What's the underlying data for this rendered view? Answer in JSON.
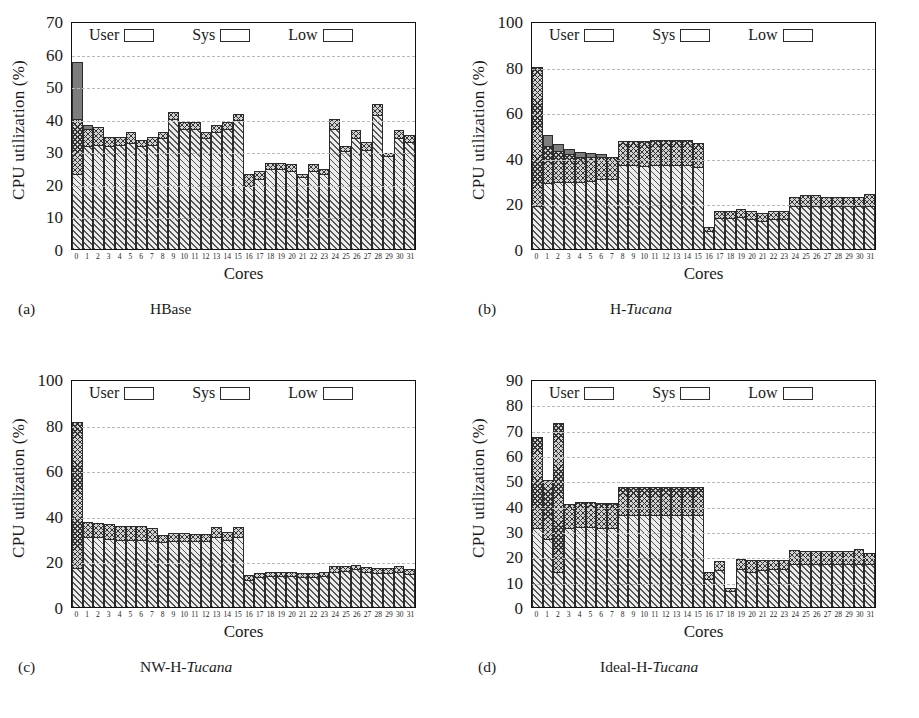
{
  "figure": {
    "axis_label_y": "CPU utilization (%)",
    "axis_label_x": "Cores",
    "legend": [
      {
        "label": "User",
        "pattern": "diagonal-hatch",
        "color": "#ececec"
      },
      {
        "label": "Sys",
        "pattern": "cross-hatch",
        "color": "#d2d2d2"
      },
      {
        "label": "Low",
        "pattern": "solid",
        "color": "#7d7d7d"
      }
    ],
    "core_labels": [
      "0",
      "1",
      "2",
      "3",
      "4",
      "5",
      "6",
      "7",
      "8",
      "9",
      "10",
      "11",
      "12",
      "13",
      "14",
      "15",
      "16",
      "17",
      "18",
      "19",
      "20",
      "21",
      "22",
      "23",
      "24",
      "25",
      "26",
      "27",
      "28",
      "29",
      "30",
      "31"
    ]
  },
  "panels": [
    {
      "tag": "(a)",
      "caption_plain": "HBase",
      "caption_italic": ""
    },
    {
      "tag": "(b)",
      "caption_plain": "H-",
      "caption_italic": "Tucana"
    },
    {
      "tag": "(c)",
      "caption_plain": "NW-H-",
      "caption_italic": "Tucana"
    },
    {
      "tag": "(d)",
      "caption_plain": "Ideal-H-",
      "caption_italic": "Tucana"
    }
  ],
  "chart_data": [
    {
      "type": "bar",
      "subplot": "(a)",
      "title": "HBase",
      "xlabel": "Cores",
      "ylabel": "CPU utilization (%)",
      "ylim": [
        0,
        70
      ],
      "yticks": [
        0,
        10,
        20,
        30,
        40,
        50,
        60,
        70
      ],
      "grid": true,
      "legend_position": "top-inside",
      "stacked": true,
      "categories": [
        "0",
        "1",
        "2",
        "3",
        "4",
        "5",
        "6",
        "7",
        "8",
        "9",
        "10",
        "11",
        "12",
        "13",
        "14",
        "15",
        "16",
        "17",
        "18",
        "19",
        "20",
        "21",
        "22",
        "23",
        "24",
        "25",
        "26",
        "27",
        "28",
        "29",
        "30",
        "31"
      ],
      "series": [
        {
          "name": "User",
          "values": [
            23,
            31.5,
            32,
            31.5,
            32,
            32.5,
            31.5,
            32,
            34,
            40,
            37,
            37,
            34,
            36,
            37,
            39.5,
            19.5,
            21.5,
            24.5,
            24.5,
            24,
            22,
            24,
            23,
            37,
            30,
            34,
            30.5,
            41,
            28.5,
            34,
            33
          ]
        },
        {
          "name": "Sys",
          "values": [
            17,
            5.5,
            5.5,
            3,
            2.5,
            3.5,
            2,
            2.5,
            2,
            2,
            2,
            2,
            2,
            2,
            2,
            2,
            3.5,
            2.5,
            2,
            2,
            2,
            1,
            2,
            1.5,
            3,
            1.5,
            2.5,
            2.5,
            3.5,
            1,
            2.5,
            2
          ]
        },
        {
          "name": "Low",
          "values": [
            17.5,
            1,
            0,
            0,
            0,
            0,
            0,
            0,
            0,
            0,
            0,
            0,
            0,
            0,
            0,
            0,
            0,
            0,
            0,
            0,
            0,
            0,
            0,
            0,
            0,
            0,
            0,
            0,
            0,
            0,
            0,
            0
          ]
        }
      ]
    },
    {
      "type": "bar",
      "subplot": "(b)",
      "title": "H-Tucana",
      "xlabel": "Cores",
      "ylabel": "CPU utilization (%)",
      "ylim": [
        0,
        100
      ],
      "yticks": [
        0,
        20,
        40,
        60,
        80,
        100
      ],
      "grid": true,
      "legend_position": "top-inside",
      "stacked": true,
      "categories": [
        "0",
        "1",
        "2",
        "3",
        "4",
        "5",
        "6",
        "7",
        "8",
        "9",
        "10",
        "11",
        "12",
        "13",
        "14",
        "15",
        "16",
        "17",
        "18",
        "19",
        "20",
        "21",
        "22",
        "23",
        "24",
        "25",
        "26",
        "27",
        "28",
        "29",
        "30",
        "31"
      ],
      "series": [
        {
          "name": "User",
          "values": [
            19,
            29,
            29.5,
            29.5,
            29.5,
            30,
            30.5,
            30.5,
            37,
            37,
            36.5,
            37,
            37,
            37,
            37,
            36,
            8,
            13.5,
            13.5,
            14,
            13,
            12.5,
            13,
            13,
            19,
            19,
            19,
            19,
            19,
            19,
            19,
            19
          ]
        },
        {
          "name": "Sys",
          "values": [
            61,
            16,
            13.5,
            12,
            11,
            10.5,
            10,
            10,
            10.5,
            10.5,
            11,
            11,
            11,
            11,
            11,
            10.5,
            1.5,
            3,
            3,
            3.5,
            3.5,
            3.5,
            3.5,
            3.5,
            4,
            4.5,
            4.5,
            4,
            4,
            4,
            4,
            5
          ]
        },
        {
          "name": "Low",
          "values": [
            0,
            5,
            3,
            2.5,
            2,
            1.5,
            1,
            0,
            0,
            0,
            0,
            0,
            0,
            0,
            0,
            0,
            0,
            0,
            0,
            0,
            0,
            0,
            0,
            0,
            0,
            0,
            0,
            0,
            0,
            0,
            0,
            0
          ]
        }
      ]
    },
    {
      "type": "bar",
      "subplot": "(c)",
      "title": "NW-H-Tucana",
      "xlabel": "Cores",
      "ylabel": "CPU utilization (%)",
      "ylim": [
        0,
        100
      ],
      "yticks": [
        0,
        20,
        40,
        60,
        80,
        100
      ],
      "grid": true,
      "legend_position": "top-inside",
      "stacked": true,
      "categories": [
        "0",
        "1",
        "2",
        "3",
        "4",
        "5",
        "6",
        "7",
        "8",
        "9",
        "10",
        "11",
        "12",
        "13",
        "14",
        "15",
        "16",
        "17",
        "18",
        "19",
        "20",
        "21",
        "22",
        "23",
        "24",
        "25",
        "26",
        "27",
        "28",
        "29",
        "30",
        "31"
      ],
      "series": [
        {
          "name": "User",
          "values": [
            17,
            30.5,
            30.5,
            30,
            29.5,
            29.5,
            29.5,
            29,
            28.5,
            29,
            29,
            29,
            29,
            30.5,
            29.5,
            30.5,
            12,
            13,
            13.5,
            13.5,
            13.5,
            13,
            13,
            13.5,
            15.5,
            16,
            16.5,
            15.5,
            15,
            15,
            15.5,
            14.5
          ]
        },
        {
          "name": "Sys",
          "values": [
            64,
            7,
            6.5,
            6.5,
            6,
            6,
            6,
            5.5,
            3,
            3.5,
            3.5,
            3,
            3,
            4.5,
            3.5,
            4.5,
            2,
            2,
            2,
            2,
            2,
            2,
            2,
            2,
            2.5,
            2,
            2,
            2,
            2,
            2,
            2.5,
            2
          ]
        },
        {
          "name": "Low",
          "values": [
            0,
            0,
            0,
            0,
            0,
            0,
            0,
            0,
            0,
            0,
            0,
            0,
            0,
            0,
            0,
            0,
            0,
            0,
            0,
            0,
            0,
            0,
            0,
            0,
            0,
            0,
            0,
            0,
            0,
            0,
            0,
            0
          ]
        }
      ]
    },
    {
      "type": "bar",
      "subplot": "(d)",
      "title": "Ideal-H-Tucana",
      "xlabel": "Cores",
      "ylabel": "CPU utilization (%)",
      "ylim": [
        0,
        90
      ],
      "yticks": [
        0,
        10,
        20,
        30,
        40,
        50,
        60,
        70,
        80,
        90
      ],
      "grid": true,
      "legend_position": "top-inside",
      "stacked": true,
      "categories": [
        "0",
        "1",
        "2",
        "3",
        "4",
        "5",
        "6",
        "7",
        "8",
        "9",
        "10",
        "11",
        "12",
        "13",
        "14",
        "15",
        "16",
        "17",
        "18",
        "19",
        "20",
        "21",
        "22",
        "23",
        "24",
        "25",
        "26",
        "27",
        "28",
        "29",
        "30",
        "31"
      ],
      "series": [
        {
          "name": "User",
          "values": [
            31,
            27,
            14,
            31,
            31.5,
            31.5,
            31,
            31,
            36.5,
            36.5,
            36.5,
            36.5,
            36.5,
            36.5,
            36.5,
            36.5,
            11,
            14.5,
            6.5,
            15,
            14,
            14.5,
            15,
            15,
            17,
            17,
            17,
            17,
            17,
            17,
            17,
            17
          ]
        },
        {
          "name": "Sys",
          "values": [
            36,
            23,
            58.5,
            9.5,
            10,
            10,
            10,
            10,
            11,
            11,
            11,
            11,
            11,
            11,
            11,
            11,
            3,
            3.5,
            1,
            4,
            4.5,
            4,
            3.5,
            3.5,
            5.5,
            5,
            5,
            5,
            5,
            5,
            6,
            4.5
          ]
        },
        {
          "name": "Low",
          "values": [
            0,
            0,
            0,
            0,
            0,
            0,
            0,
            0,
            0,
            0,
            0,
            0,
            0,
            0,
            0,
            0,
            0,
            0,
            0,
            0,
            0,
            0,
            0,
            0,
            0,
            0,
            0,
            0,
            0,
            0,
            0,
            0
          ]
        }
      ]
    }
  ]
}
